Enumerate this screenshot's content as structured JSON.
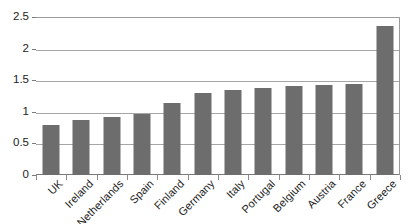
{
  "chart_data": {
    "type": "bar",
    "title": "",
    "subtitle": "",
    "xlabel": "",
    "ylabel": "",
    "categories": [
      "UK",
      "Ireland",
      "Netherlands",
      "Spain",
      "Finland",
      "Germany",
      "Italy",
      "Portugal",
      "Belgium",
      "Austria",
      "France",
      "Greece"
    ],
    "values": [
      0.79,
      0.87,
      0.92,
      0.97,
      1.14,
      1.29,
      1.35,
      1.38,
      1.41,
      1.42,
      1.44,
      2.36
    ],
    "series": [
      {
        "name": "",
        "values": [
          0.79,
          0.87,
          0.92,
          0.97,
          1.14,
          1.29,
          1.35,
          1.38,
          1.41,
          1.42,
          1.44,
          2.36
        ]
      }
    ],
    "ylim": [
      0,
      2.5
    ],
    "yticks": [
      0,
      0.5,
      1,
      1.5,
      2,
      2.5
    ],
    "ytick_labels": [
      "0",
      "0.5",
      "1",
      "1.5",
      "2",
      "2.5"
    ],
    "grid": true,
    "grid_axis": "y",
    "legend": false,
    "legend_position": "none",
    "annotations": [],
    "bar_color": "#6d6d6d",
    "gridline_color": "#a6a6a6",
    "axis_color": "#7a7a7a",
    "background_color": "#ffffff",
    "text_color": "#1a1a1a",
    "xtick_label_rotation": -45
  }
}
